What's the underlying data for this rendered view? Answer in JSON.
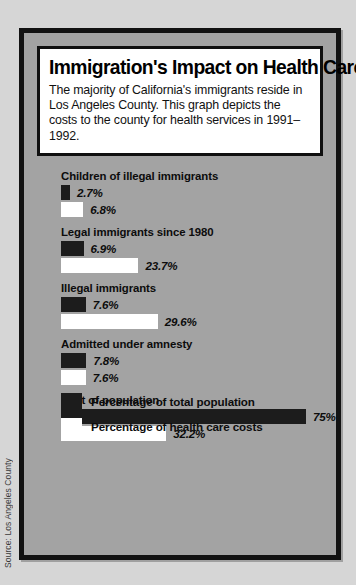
{
  "source_note": "Source: Los Angeles County",
  "title": "Immigration's Impact on Health Care",
  "subtitle": "The majority of California's immigrants reside in Los Angeles County. This graph depicts the costs to the county for health services in 1991–1992.",
  "legend": [
    {
      "key": "population",
      "label": "Percentage of total population",
      "color": "#1c1c1c"
    },
    {
      "key": "cost",
      "label": "Percentage of health care costs",
      "color": "#ffffff"
    }
  ],
  "chart_data": {
    "type": "bar",
    "title": "Immigration's Impact on Health Care",
    "xlabel": "",
    "ylabel": "",
    "orientation": "horizontal",
    "grid": false,
    "legend_position": "bottom",
    "xlim": [
      0,
      75
    ],
    "categories": [
      "Children of illegal immigrants",
      "Legal immigrants since 1980",
      "Illegal immigrants",
      "Admitted under amnesty",
      "Rest of population"
    ],
    "series": [
      {
        "name": "Percentage of total population",
        "color": "#1c1c1c",
        "values": [
          2.7,
          6.9,
          7.6,
          7.8,
          75
        ],
        "labels": [
          "2.7%",
          "6.9%",
          "7.6%",
          "7.8%",
          "75%"
        ]
      },
      {
        "name": "Percentage of health care costs",
        "color": "#ffffff",
        "values": [
          6.8,
          23.7,
          29.6,
          7.6,
          32.2
        ],
        "labels": [
          "6.8%",
          "23.7%",
          "29.6%",
          "7.6%",
          "32.2%"
        ]
      }
    ]
  }
}
